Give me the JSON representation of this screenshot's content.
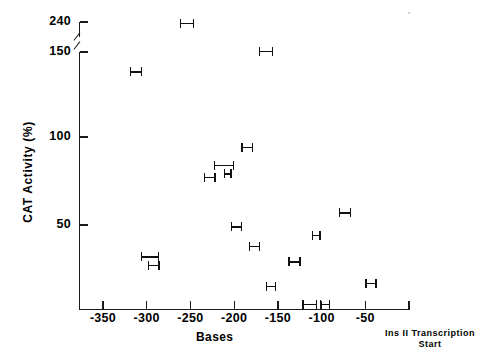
{
  "chart_data": {
    "type": "scatter",
    "title": "",
    "xlabel": "Bases",
    "ylabel": "CAT Activity (%)",
    "xlim": [
      -380,
      0
    ],
    "ylim": [
      0,
      240
    ],
    "grid": false,
    "legend": "none",
    "axis_break": {
      "between": [
        150,
        240
      ],
      "axis": "y"
    },
    "y_ticks": [
      {
        "value": 240,
        "label": "240"
      },
      {
        "value": 150,
        "label": "150"
      },
      {
        "value": 100,
        "label": "100"
      },
      {
        "value": 50,
        "label": "50"
      }
    ],
    "x_ticks": [
      {
        "value": -350,
        "label": "-350"
      },
      {
        "value": -300,
        "label": "-300"
      },
      {
        "value": -250,
        "label": "-250"
      },
      {
        "value": -200,
        "label": "-200"
      },
      {
        "value": -150,
        "label": "-150"
      },
      {
        "value": -100,
        "label": "-100"
      },
      {
        "value": -50,
        "label": "-50"
      }
    ],
    "origin_annotation": {
      "line1": "Ins II Transcription",
      "line2": "Start"
    },
    "points": [
      {
        "x": -253,
        "x_low": -262,
        "x_high": -246,
        "y": 237
      },
      {
        "x": -164,
        "x_low": -172,
        "x_high": -155,
        "y": 153
      },
      {
        "x": -312,
        "x_low": -319,
        "x_high": -305,
        "y": 137
      },
      {
        "x": -185,
        "x_low": -192,
        "x_high": -178,
        "y": 94
      },
      {
        "x": -210,
        "x_low": -223,
        "x_high": -200,
        "y": 84
      },
      {
        "x": -208,
        "x_low": -212,
        "x_high": -203,
        "y": 79
      },
      {
        "x": -228,
        "x_low": -235,
        "x_high": -221,
        "y": 77
      },
      {
        "x": -73,
        "x_low": -80,
        "x_high": -66,
        "y": 57
      },
      {
        "x": -197,
        "x_low": -204,
        "x_high": -191,
        "y": 49
      },
      {
        "x": -106,
        "x_low": -111,
        "x_high": -101,
        "y": 44
      },
      {
        "x": -176,
        "x_low": -183,
        "x_high": -170,
        "y": 38
      },
      {
        "x": -295,
        "x_low": -307,
        "x_high": -286,
        "y": 32
      },
      {
        "x": -131,
        "x_low": -138,
        "x_high": -124,
        "y": 29
      },
      {
        "x": -292,
        "x_low": -299,
        "x_high": -285,
        "y": 27
      },
      {
        "x": -43,
        "x_low": -50,
        "x_high": -37,
        "y": 17
      },
      {
        "x": -158,
        "x_low": -164,
        "x_high": -152,
        "y": 15
      },
      {
        "x": -113,
        "x_low": -122,
        "x_high": -105,
        "y": 5
      },
      {
        "x": -96,
        "x_low": -102,
        "x_high": -90,
        "y": 5
      }
    ]
  }
}
